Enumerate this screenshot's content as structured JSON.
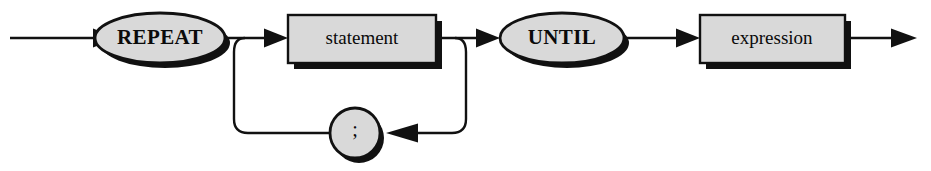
{
  "diagram": {
    "kind": "railroad-syntax-diagram",
    "title": "REPEAT statement",
    "background_color": "#ffffff",
    "line_color": "#111111",
    "node_fill_color": "#d9d9d9",
    "shadow_color": "#111111",
    "nodes": [
      {
        "id": "repeat-keyword",
        "label": "REPEAT",
        "shape": "ellipse",
        "role": "terminal",
        "cx": 160,
        "cy": 38,
        "rx": 65,
        "ry": 25
      },
      {
        "id": "statement-node",
        "label": "statement",
        "shape": "rectangle",
        "role": "nonterminal",
        "x": 288,
        "y": 15,
        "width": 148,
        "height": 48
      },
      {
        "id": "until-keyword",
        "label": "UNTIL",
        "shape": "ellipse",
        "role": "terminal",
        "cx": 562,
        "cy": 38,
        "rx": 62,
        "ry": 25
      },
      {
        "id": "expression-node",
        "label": "expression",
        "shape": "rectangle",
        "role": "nonterminal",
        "x": 700,
        "y": 15,
        "width": 145,
        "height": 48
      },
      {
        "id": "semicolon-separator",
        "label": ";",
        "shape": "circle",
        "role": "terminal",
        "cx": 355,
        "cy": 133,
        "r": 25
      }
    ],
    "connections": [
      {
        "id": "entry-rail",
        "from": "start",
        "to": "repeat-keyword",
        "arrow": true
      },
      {
        "id": "repeat-to-statement-rail",
        "from": "repeat-keyword",
        "to": "statement-node",
        "arrow": true
      },
      {
        "id": "statement-to-until-rail",
        "from": "statement-node",
        "to": "until-keyword",
        "arrow": true
      },
      {
        "id": "until-to-expression-rail",
        "from": "until-keyword",
        "to": "expression-node",
        "arrow": true
      },
      {
        "id": "exit-rail",
        "from": "expression-node",
        "to": "end",
        "arrow": true
      },
      {
        "id": "loop-return-rail",
        "from": "statement-node",
        "to": "semicolon-separator",
        "arrow": true
      },
      {
        "id": "loop-back-rail",
        "from": "semicolon-separator",
        "to": "statement-node",
        "arrow": false
      }
    ]
  }
}
